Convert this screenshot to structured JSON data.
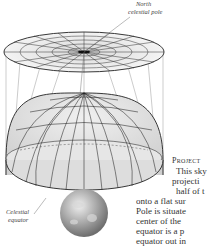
{
  "figure": {
    "labels": {
      "north_pole_line1": "North",
      "north_pole_line2": "celestial pole",
      "equator_line1": "Celestial",
      "equator_line2": "equator"
    }
  },
  "caption": {
    "title": "Project",
    "lines": [
      "This sky",
      "projecti",
      "half of t",
      "onto a flat sur",
      "Pole is situate",
      "center of the",
      "equator is a p",
      "equator out in"
    ]
  }
}
